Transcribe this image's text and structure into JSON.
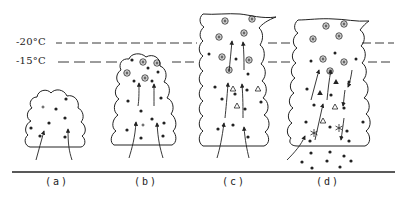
{
  "figure": {
    "type": "schematic",
    "isotherms": [
      {
        "label": "-20°C",
        "y": 43
      },
      {
        "label": "-15°C",
        "y": 62
      }
    ],
    "panels": [
      {
        "label": "(a)",
        "content": "small cumulus with cloud droplets and updrafts"
      },
      {
        "label": "(b)",
        "content": "growing cumulus reaching -15°C with ice crystals near top"
      },
      {
        "label": "(c)",
        "content": "towering cumulus above -20°C with ice crystals, graupel (triangles), droplets"
      },
      {
        "label": "(d)",
        "content": "mature cumulonimbus with graupel, snowflakes, downdrafts and rain falling below base"
      }
    ],
    "legend_symbols": {
      "dot": "cloud/rain droplet",
      "circled-star": "ice crystal",
      "triangle-open": "graupel (small)",
      "triangle-filled": "graupel/hail",
      "asterisk": "snowflake",
      "arrow": "air motion (updraft/downdraft)"
    }
  },
  "labels": {
    "t20": "-20°C",
    "t15": "-15°C",
    "a": "(a)",
    "b": "(b)",
    "c": "(c)",
    "d": "(d)"
  },
  "colors": {
    "ink": "#222222",
    "background": "#ffffff"
  }
}
